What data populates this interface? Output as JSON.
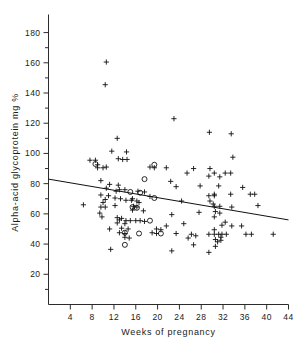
{
  "chart_data": {
    "type": "scatter",
    "title": "",
    "xlabel": "Weeks of pregnancy",
    "ylabel": "Alpha-acid glycoprotein mg %",
    "xlim": [
      0,
      44
    ],
    "ylim": [
      0,
      188
    ],
    "xticks": [
      4,
      8,
      12,
      16,
      20,
      24,
      28,
      32,
      36,
      40,
      44
    ],
    "yticks": [
      20,
      40,
      60,
      80,
      100,
      120,
      140,
      160,
      180
    ],
    "y_minor_ticks": [
      10,
      30,
      50,
      70,
      90,
      110,
      130,
      150,
      170
    ],
    "grid": false,
    "legend": "none",
    "series": [
      {
        "name": "plus-markers",
        "marker": "plus",
        "points": [
          [
            10.6,
            160.5
          ],
          [
            10.4,
            145.5
          ],
          [
            23.0,
            123.0
          ],
          [
            29.5,
            114.0
          ],
          [
            33.5,
            113.0
          ],
          [
            12.6,
            110.0
          ],
          [
            14.3,
            101.0
          ],
          [
            11.6,
            101.5
          ],
          [
            12.8,
            96.5
          ],
          [
            13.6,
            96.0
          ],
          [
            14.4,
            96.0
          ],
          [
            7.6,
            95.5
          ],
          [
            8.6,
            95.5
          ],
          [
            9.0,
            92.5
          ],
          [
            9.0,
            90.5
          ],
          [
            33.8,
            97.5
          ],
          [
            10.6,
            91.0
          ],
          [
            10.0,
            90.5
          ],
          [
            18.6,
            91.0
          ],
          [
            19.4,
            90.5
          ],
          [
            21.6,
            90.5
          ],
          [
            26.6,
            90.0
          ],
          [
            29.6,
            90.0
          ],
          [
            25.4,
            87.0
          ],
          [
            30.4,
            87.0
          ],
          [
            32.4,
            87.0
          ],
          [
            33.4,
            87.0
          ],
          [
            29.4,
            85.0
          ],
          [
            31.4,
            84.5
          ],
          [
            22.4,
            81.5
          ],
          [
            9.6,
            82.0
          ],
          [
            11.2,
            79.5
          ],
          [
            12.8,
            79.0
          ],
          [
            23.4,
            78.0
          ],
          [
            27.8,
            78.5
          ],
          [
            31.2,
            78.5
          ],
          [
            35.6,
            77.5
          ],
          [
            10.6,
            77.0
          ],
          [
            13.0,
            76.0
          ],
          [
            14.0,
            76.0
          ],
          [
            12.4,
            75.0
          ],
          [
            16.4,
            75.0
          ],
          [
            17.6,
            74.5
          ],
          [
            9.6,
            72.5
          ],
          [
            11.0,
            72.0
          ],
          [
            30.4,
            73.0
          ],
          [
            33.4,
            73.0
          ],
          [
            37.0,
            73.0
          ],
          [
            37.8,
            73.0
          ],
          [
            12.2,
            70.5
          ],
          [
            13.2,
            70.0
          ],
          [
            15.4,
            70.0
          ],
          [
            18.6,
            71.5
          ],
          [
            29.4,
            72.0
          ],
          [
            30.4,
            72.0
          ],
          [
            10.4,
            69.5
          ],
          [
            14.2,
            69.0
          ],
          [
            15.2,
            69.0
          ],
          [
            16.2,
            68.5
          ],
          [
            24.4,
            68.5
          ],
          [
            29.6,
            68.5
          ],
          [
            10.0,
            67.5
          ],
          [
            16.6,
            67.5
          ],
          [
            30.2,
            66.5
          ],
          [
            6.4,
            66.0
          ],
          [
            12.2,
            65.5
          ],
          [
            15.6,
            65.0
          ],
          [
            16.2,
            64.5
          ],
          [
            30.4,
            65.0
          ],
          [
            31.4,
            65.0
          ],
          [
            33.6,
            64.5
          ],
          [
            38.4,
            65.5
          ],
          [
            9.6,
            64.5
          ],
          [
            10.4,
            64.5
          ],
          [
            15.4,
            62.5
          ],
          [
            17.4,
            62.0
          ],
          [
            30.6,
            61.5
          ],
          [
            31.4,
            60.5
          ],
          [
            27.6,
            61.0
          ],
          [
            9.4,
            60.5
          ],
          [
            9.8,
            58.0
          ],
          [
            12.6,
            57.5
          ],
          [
            13.4,
            57.0
          ],
          [
            22.6,
            59.5
          ],
          [
            30.4,
            58.0
          ],
          [
            13.0,
            56.0
          ],
          [
            14.2,
            55.5
          ],
          [
            15.0,
            55.5
          ],
          [
            16.0,
            55.5
          ],
          [
            16.8,
            55.5
          ],
          [
            17.6,
            55.0
          ],
          [
            24.8,
            53.5
          ],
          [
            32.4,
            54.5
          ],
          [
            12.6,
            54.0
          ],
          [
            14.0,
            53.5
          ],
          [
            21.6,
            52.0
          ],
          [
            31.8,
            52.5
          ],
          [
            33.6,
            52.0
          ],
          [
            35.4,
            52.0
          ],
          [
            11.2,
            50.0
          ],
          [
            13.4,
            50.5
          ],
          [
            14.6,
            50.0
          ],
          [
            19.8,
            50.0
          ],
          [
            20.6,
            49.5
          ],
          [
            30.4,
            49.5
          ],
          [
            13.0,
            47.5
          ],
          [
            14.0,
            47.0
          ],
          [
            19.0,
            47.5
          ],
          [
            19.8,
            47.0
          ],
          [
            23.4,
            47.0
          ],
          [
            26.2,
            46.5
          ],
          [
            29.4,
            46.5
          ],
          [
            30.4,
            46.5
          ],
          [
            31.2,
            46.5
          ],
          [
            31.8,
            46.5
          ],
          [
            32.6,
            46.5
          ],
          [
            36.2,
            46.5
          ],
          [
            37.2,
            46.5
          ],
          [
            41.2,
            46.5
          ],
          [
            27.0,
            45.5
          ],
          [
            31.6,
            44.5
          ],
          [
            14.0,
            44.5
          ],
          [
            14.8,
            44.0
          ],
          [
            25.6,
            44.0
          ],
          [
            30.6,
            43.0
          ],
          [
            31.6,
            42.5
          ],
          [
            31.0,
            41.5
          ],
          [
            30.6,
            38.5
          ],
          [
            26.6,
            39.5
          ],
          [
            11.4,
            36.5
          ],
          [
            22.6,
            35.5
          ],
          [
            29.4,
            34.5
          ]
        ]
      },
      {
        "name": "circle-markers",
        "marker": "circle",
        "points": [
          [
            8.6,
            93.0
          ],
          [
            19.4,
            92.5
          ],
          [
            17.6,
            83.0
          ],
          [
            15.0,
            74.5
          ],
          [
            16.8,
            74.0
          ],
          [
            19.4,
            70.5
          ],
          [
            15.4,
            64.5
          ],
          [
            16.2,
            64.0
          ],
          [
            18.6,
            55.5
          ],
          [
            14.0,
            47.5
          ],
          [
            16.6,
            47.0
          ],
          [
            20.6,
            47.0
          ],
          [
            14.0,
            39.5
          ]
        ]
      }
    ],
    "fit_line": {
      "name": "regression-line",
      "x_start": 0.0,
      "y_start": 83.0,
      "x_end": 44.0,
      "y_end": 56.0
    }
  },
  "colors": {
    "background": "#ffffff",
    "axis": "#2b2b2b",
    "marker": "#111111",
    "text": "#1a1a1a"
  }
}
